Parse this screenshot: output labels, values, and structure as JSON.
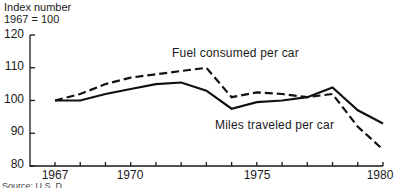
{
  "chart_data": {
    "type": "line",
    "title": "",
    "ylabel": "Index number\n1967 = 100",
    "ylabel_lines": [
      "Index number",
      "1967 = 100"
    ],
    "xlabel": "",
    "x": [
      1967,
      1968,
      1969,
      1970,
      1971,
      1972,
      1973,
      1974,
      1975,
      1976,
      1977,
      1978,
      1979,
      1980
    ],
    "series": [
      {
        "name": "Fuel consumed per car",
        "style": "dashed",
        "values": [
          100,
          102,
          105,
          107,
          108,
          109,
          110,
          101,
          102.5,
          102,
          101,
          102,
          92,
          85
        ]
      },
      {
        "name": "Miles traveled per car",
        "style": "solid",
        "values": [
          100,
          100,
          102,
          103.5,
          105,
          105.5,
          103,
          97.5,
          99.5,
          100,
          101,
          104,
          97,
          93
        ]
      }
    ],
    "ylim": [
      80,
      120
    ],
    "yticks": [
      80,
      90,
      100,
      110,
      120
    ],
    "xticks_labeled": [
      1967,
      1970,
      1975,
      1980
    ],
    "grid": false,
    "legend": "inline labels",
    "source_note": "Source: U.S. D..."
  },
  "labels": {
    "ylabel_line1": "Index number",
    "ylabel_line2": "1967 = 100",
    "y120": "120",
    "y110": "110",
    "y100": "100",
    "y90": "90",
    "y80": "80",
    "x1967": "1967",
    "x1970": "1970",
    "x1975": "1975",
    "x1980": "1980",
    "fuel": "Fuel consumed per car",
    "miles": "Miles traveled per car",
    "source": "Source: U.S. D..."
  }
}
